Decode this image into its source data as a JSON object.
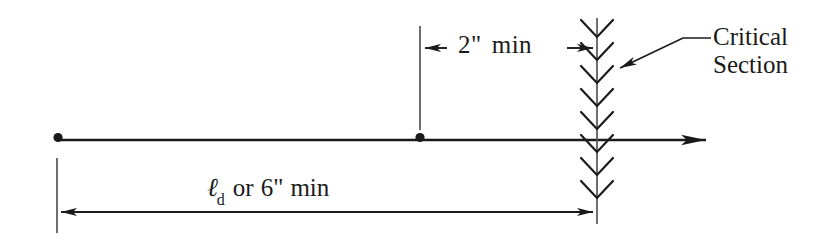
{
  "diagram": {
    "background_color": "#ffffff",
    "line_color": "#1a1a1a",
    "labels": {
      "top_dimension": {
        "value": "2\"",
        "qualifier": "min",
        "full": "2\" min"
      },
      "bottom_dimension": {
        "symbol": "ℓ",
        "subscript": "d",
        "conjunction": "or",
        "value": "6\"",
        "qualifier": "min",
        "full": "ℓd or 6\" min"
      },
      "callout": {
        "line1": "Critical",
        "line2": "Section",
        "full": "Critical Section"
      }
    },
    "geometry": {
      "bar_line_y": 140,
      "bar_start_x": 57,
      "bar_end_x": 712,
      "left_node_x": 57,
      "mid_node_x": 420,
      "critical_section_x": 597,
      "top_dim_line_y": 48,
      "bottom_dim_line_y": 212,
      "chevron_count": 8,
      "chevron_spacing": 23,
      "chevron_top_y": 35,
      "chevron_bottom_y": 195,
      "section_line_top_y": 18,
      "section_line_bottom_y": 224
    }
  }
}
